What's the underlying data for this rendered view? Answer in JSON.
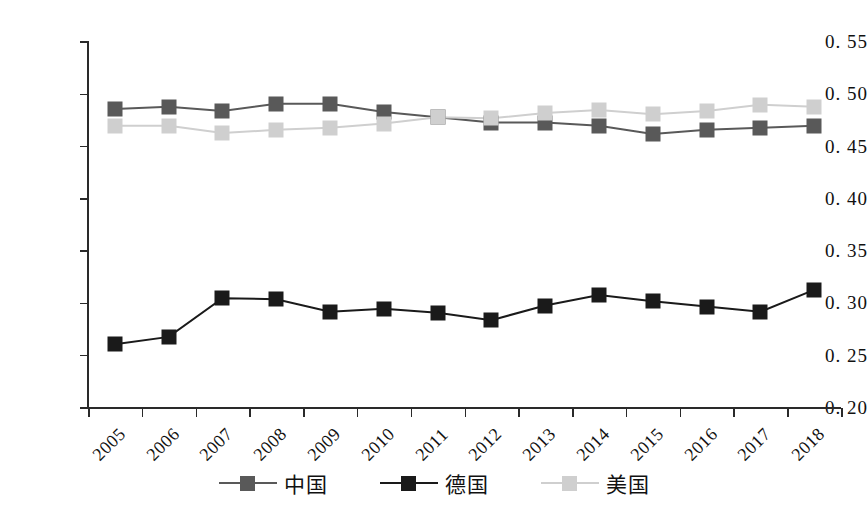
{
  "chart_data": {
    "type": "line",
    "title": "",
    "xlabel": "",
    "ylabel": "",
    "categories": [
      "2005",
      "2006",
      "2007",
      "2008",
      "2009",
      "2010",
      "2011",
      "2012",
      "2013",
      "2014",
      "2015",
      "2016",
      "2017",
      "2018"
    ],
    "ylim": [
      0.2,
      0.55
    ],
    "yticks": [
      "0. 20",
      "0. 25",
      "0. 30",
      "0. 35",
      "0. 40",
      "0. 45",
      "0. 50",
      "0. 55"
    ],
    "ytick_values": [
      0.2,
      0.25,
      0.3,
      0.35,
      0.4,
      0.45,
      0.5,
      0.55
    ],
    "grid": false,
    "legend_position": "bottom",
    "series": [
      {
        "name": "中国",
        "color": "#595959",
        "marker": "square",
        "values": [
          0.486,
          0.488,
          0.484,
          0.491,
          0.491,
          0.483,
          0.478,
          0.473,
          0.473,
          0.47,
          0.462,
          0.466,
          0.468,
          0.47
        ]
      },
      {
        "name": "德国",
        "color": "#1a1a1a",
        "marker": "square",
        "values": [
          0.261,
          0.268,
          0.305,
          0.304,
          0.292,
          0.295,
          0.291,
          0.284,
          0.298,
          0.308,
          0.302,
          0.297,
          0.292,
          0.313
        ]
      },
      {
        "name": "美国",
        "color": "#cfcfcf",
        "marker": "square",
        "values": [
          0.47,
          0.47,
          0.463,
          0.466,
          0.468,
          0.472,
          0.478,
          0.477,
          0.482,
          0.485,
          0.481,
          0.484,
          0.49,
          0.488
        ]
      }
    ]
  }
}
